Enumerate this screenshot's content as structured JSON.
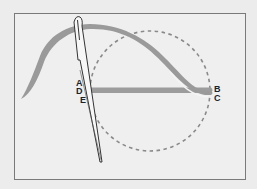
{
  "diagram": {
    "colors": {
      "background": "#ececec",
      "frame_fill": "#efefef",
      "frame_border": "#7a7a7a",
      "thread": "#9a9a9a",
      "thread_highlight": "#f5f5f5",
      "needle_outline": "#333333",
      "dashed_circle": "#8a8a8a"
    },
    "labels": [
      {
        "id": "A",
        "text": "A",
        "x": 76,
        "y": 79
      },
      {
        "id": "D",
        "text": "D",
        "x": 76,
        "y": 87
      },
      {
        "id": "E",
        "text": "E",
        "x": 80,
        "y": 96
      },
      {
        "id": "B",
        "text": "B",
        "x": 214,
        "y": 85
      },
      {
        "id": "C",
        "text": "C",
        "x": 214,
        "y": 94
      }
    ]
  }
}
